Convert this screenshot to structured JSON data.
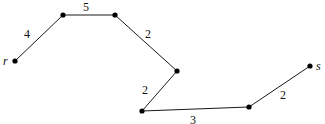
{
  "diagram": {
    "type": "weighted-path-graph",
    "nodes": [
      {
        "id": "r",
        "label": "r",
        "x": 15,
        "y": 61,
        "lx": 3,
        "ly": 65
      },
      {
        "id": "n1",
        "label": "",
        "x": 63,
        "y": 15
      },
      {
        "id": "n2",
        "label": "",
        "x": 115,
        "y": 15
      },
      {
        "id": "n3",
        "label": "",
        "x": 177,
        "y": 71
      },
      {
        "id": "n4",
        "label": "",
        "x": 142,
        "y": 111
      },
      {
        "id": "n5",
        "label": "",
        "x": 249,
        "y": 107
      },
      {
        "id": "s",
        "label": "s",
        "x": 310,
        "y": 66,
        "lx": 316,
        "ly": 70
      }
    ],
    "edges": [
      {
        "from": "r",
        "to": "n1",
        "weight": "4",
        "lx": 27,
        "ly": 38
      },
      {
        "from": "n1",
        "to": "n2",
        "weight": "5",
        "lx": 86,
        "ly": 11
      },
      {
        "from": "n2",
        "to": "n3",
        "weight": "2",
        "lx": 148,
        "ly": 38
      },
      {
        "from": "n3",
        "to": "n4",
        "weight": "2",
        "lx": 145,
        "ly": 94
      },
      {
        "from": "n4",
        "to": "n5",
        "weight": "3",
        "lx": 193,
        "ly": 124
      },
      {
        "from": "n5",
        "to": "s",
        "weight": "2",
        "lx": 283,
        "ly": 99
      }
    ]
  }
}
